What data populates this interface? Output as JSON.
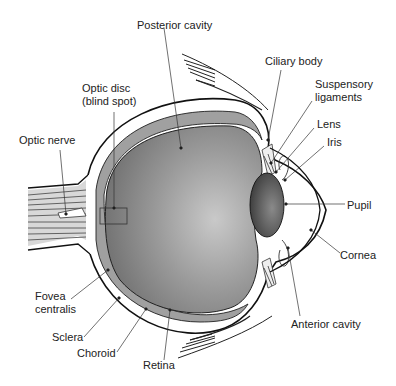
{
  "diagram": {
    "labels": {
      "posterior_cavity": "Posterior cavity",
      "ciliary_body": "Ciliary body",
      "suspensory_ligaments_1": "Suspensory",
      "suspensory_ligaments_2": "ligaments",
      "lens": "Lens",
      "iris": "Iris",
      "pupil": "Pupil",
      "cornea": "Cornea",
      "anterior_cavity": "Anterior cavity",
      "optic_disc_1": "Optic disc",
      "optic_disc_2": "(blind spot)",
      "optic_nerve": "Optic nerve",
      "fovea_1": "Fovea",
      "fovea_2": "centralis",
      "sclera": "Sclera",
      "choroid": "Choroid",
      "retina": "Retina"
    },
    "colors": {
      "vitreous": "#8c8c8c",
      "vitreous_light": "#c8c8c8",
      "choroid": "#9a9a9a",
      "lens": "#5a5a5a",
      "line": "#1a1a1a"
    }
  }
}
